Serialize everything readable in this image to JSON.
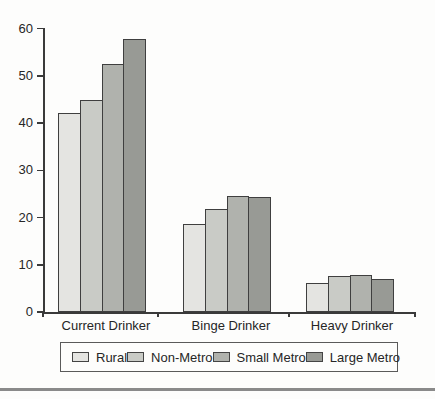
{
  "chart_data": {
    "type": "bar",
    "title": "",
    "xlabel": "",
    "ylabel": "",
    "categories": [
      "Current Drinker",
      "Binge Drinker",
      "Heavy Drinker"
    ],
    "series": [
      {
        "name": "Rural",
        "color": "#e4e4e1",
        "values": [
          42.2,
          18.7,
          6.2
        ]
      },
      {
        "name": "Non-Metro",
        "color": "#c9cbc6",
        "values": [
          44.8,
          21.9,
          7.7
        ]
      },
      {
        "name": "Small Metro",
        "color": "#b0b2ad",
        "values": [
          52.6,
          24.6,
          7.9
        ]
      },
      {
        "name": "Large Metro",
        "color": "#989a95",
        "values": [
          57.7,
          24.4,
          7.0
        ]
      }
    ],
    "ylim": [
      0,
      60
    ],
    "yticks": [
      0,
      10,
      20,
      30,
      40,
      50,
      60
    ],
    "grid": false,
    "legend_position": "bottom",
    "legend_labels": [
      "Rural",
      "Non-Metro",
      "Small Metro",
      "Large Metro"
    ],
    "axis_color": "#3a3a3a",
    "bar_border_color": "#3f3f3f"
  }
}
